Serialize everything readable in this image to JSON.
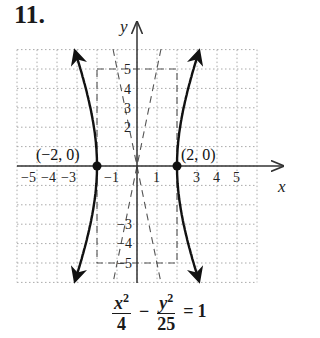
{
  "problem": {
    "number": "11."
  },
  "chart_data": {
    "type": "line",
    "title": "",
    "xlabel": "x",
    "ylabel": "y",
    "xlim": [
      -6,
      6
    ],
    "ylim": [
      -6,
      6
    ],
    "grid": true,
    "x_ticks": [
      "-5",
      "-4",
      "-3",
      "-1",
      "1",
      "3",
      "4",
      "5"
    ],
    "y_ticks": [
      "5",
      "4",
      "3",
      "2",
      "-3",
      "-4",
      "-5"
    ],
    "equation": "x^2/4 - y^2/25 = 1",
    "vertices": [
      {
        "label": "(−2, 0)",
        "x": -2,
        "y": 0
      },
      {
        "label": "(2, 0)",
        "x": 2,
        "y": 0
      }
    ],
    "asymptotes": [
      "y = 5x/2",
      "y = -5x/2"
    ],
    "fundamental_rectangle": {
      "x": [
        -2,
        2
      ],
      "y": [
        -5,
        5
      ]
    },
    "series": [
      {
        "name": "right branch",
        "style": "solid",
        "x_at": "x = 2*sqrt(1 + y^2/25)"
      },
      {
        "name": "left branch",
        "style": "solid",
        "x_at": "x = -2*sqrt(1 + y^2/25)"
      }
    ]
  },
  "labels": {
    "x_axis": "x",
    "y_axis": "y",
    "vertex_left": "(−2, 0)",
    "vertex_right": "(2, 0)",
    "xt": {
      "m5": "−5",
      "m4": "−4",
      "m3": "−3",
      "m1": "−1",
      "p1": "1",
      "p3": "3",
      "p4": "4",
      "p5": "5"
    },
    "yt": {
      "p5": "5",
      "p4": "4",
      "p3": "3",
      "p2": "2",
      "m3": "−3",
      "m4": "−4",
      "m5": "−5"
    }
  },
  "equation": {
    "num1": "x",
    "exp1": "2",
    "den1": "4",
    "op": "−",
    "num2": "y",
    "exp2": "2",
    "den2": "25",
    "eq": "=",
    "rhs": "1"
  }
}
